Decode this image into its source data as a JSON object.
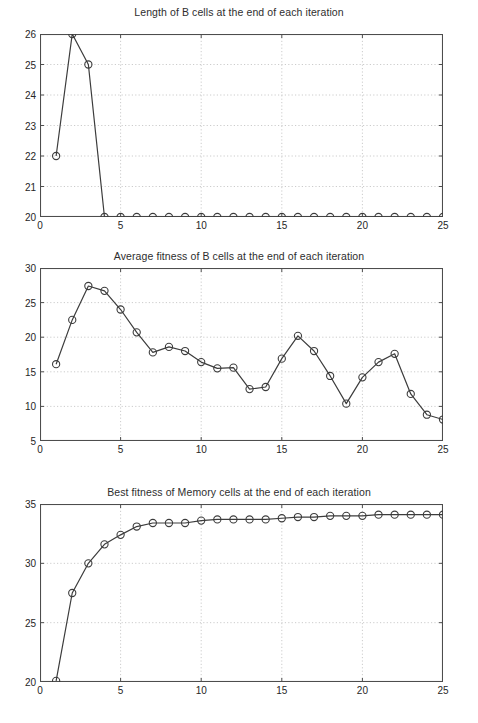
{
  "page": {
    "background": "#ffffff",
    "axis_color": "#4d4d4d",
    "grid_color": "#bfbfbf",
    "line_color": "#3c3c3c",
    "marker_color": "#3c3c3c"
  },
  "figures": [
    {
      "id": "figure-1",
      "title": "Length of B cells at the end of each iteration",
      "y_ticks": [
        "20",
        "21",
        "22",
        "23",
        "24",
        "25",
        "26"
      ],
      "x_ticks": [
        "0",
        "5",
        "10",
        "15",
        "20",
        "25"
      ]
    },
    {
      "id": "figure-2",
      "title": "Average fitness of B cells at the end of each iteration",
      "y_ticks": [
        "5",
        "10",
        "15",
        "20",
        "25",
        "30"
      ],
      "x_ticks": [
        "0",
        "5",
        "10",
        "15",
        "20",
        "25"
      ]
    },
    {
      "id": "figure-3",
      "title": "Best fitness of Memory cells at the end of each iteration",
      "y_ticks": [
        "20",
        "25",
        "30",
        "35"
      ],
      "x_ticks": [
        "0",
        "5",
        "10",
        "15",
        "20",
        "25"
      ]
    }
  ],
  "chart_data": [
    {
      "type": "line",
      "title": "Length of B cells at the end of each iteration",
      "xlabel": "",
      "ylabel": "",
      "xlim": [
        0,
        25
      ],
      "ylim": [
        20,
        26
      ],
      "xticks": [
        0,
        5,
        10,
        15,
        20,
        25
      ],
      "yticks": [
        20,
        21,
        22,
        23,
        24,
        25,
        26
      ],
      "grid": true,
      "legend": null,
      "marker": "circle",
      "x": [
        1,
        2,
        3,
        4,
        5,
        6,
        7,
        8,
        9,
        10,
        11,
        12,
        13,
        14,
        15,
        16,
        17,
        18,
        19,
        20,
        21,
        22,
        23,
        24,
        25
      ],
      "values": [
        22,
        26,
        25,
        20,
        20,
        20,
        20,
        20,
        20,
        20,
        20,
        20,
        20,
        20,
        20,
        20,
        20,
        20,
        20,
        20,
        20,
        20,
        20,
        20,
        20
      ]
    },
    {
      "type": "line",
      "title": "Average fitness of B cells at the end of each iteration",
      "xlabel": "",
      "ylabel": "",
      "xlim": [
        0,
        25
      ],
      "ylim": [
        5,
        30
      ],
      "xticks": [
        0,
        5,
        10,
        15,
        20,
        25
      ],
      "yticks": [
        5,
        10,
        15,
        20,
        25,
        30
      ],
      "grid": true,
      "legend": null,
      "marker": "circle",
      "x": [
        1,
        2,
        3,
        4,
        5,
        6,
        7,
        8,
        9,
        10,
        11,
        12,
        13,
        14,
        15,
        16,
        17,
        18,
        19,
        20,
        21,
        22,
        23,
        24,
        25
      ],
      "values": [
        16.1,
        22.5,
        27.4,
        26.7,
        24.0,
        20.7,
        17.8,
        18.6,
        18.0,
        16.4,
        15.5,
        15.6,
        12.5,
        12.8,
        16.9,
        20.2,
        18.0,
        14.4,
        10.4,
        14.2,
        16.4,
        17.6,
        11.8,
        8.8,
        8.1
      ]
    },
    {
      "type": "line",
      "title": "Best fitness of Memory cells at the end of each iteration",
      "xlabel": "",
      "ylabel": "",
      "xlim": [
        0,
        25
      ],
      "ylim": [
        20,
        35
      ],
      "xticks": [
        0,
        5,
        10,
        15,
        20,
        25
      ],
      "yticks": [
        20,
        25,
        30,
        35
      ],
      "grid": true,
      "legend": null,
      "marker": "circle",
      "x": [
        1,
        2,
        3,
        4,
        5,
        6,
        7,
        8,
        9,
        10,
        11,
        12,
        13,
        14,
        15,
        16,
        17,
        18,
        19,
        20,
        21,
        22,
        23,
        24,
        25
      ],
      "values": [
        20.1,
        27.5,
        30.0,
        31.6,
        32.4,
        33.1,
        33.4,
        33.4,
        33.4,
        33.6,
        33.7,
        33.7,
        33.7,
        33.7,
        33.8,
        33.9,
        33.9,
        34.0,
        34.0,
        34.0,
        34.1,
        34.1,
        34.1,
        34.1,
        34.1
      ]
    }
  ]
}
